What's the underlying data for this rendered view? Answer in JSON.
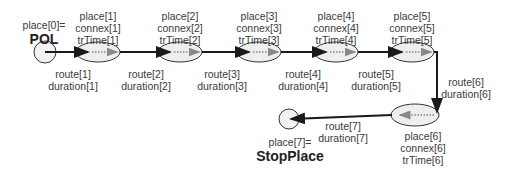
{
  "diagram": {
    "start": {
      "label": "place[0]=",
      "name": "POL"
    },
    "end": {
      "label": "place[7]=",
      "name": "StopPlace"
    },
    "places": [
      {
        "lines": [
          "place[1]",
          "connex[1]",
          "trTime[1]"
        ]
      },
      {
        "lines": [
          "place[2]",
          "connex[2]",
          "trTime[2]"
        ]
      },
      {
        "lines": [
          "place[3]",
          "connex[3]",
          "trTime[3]"
        ]
      },
      {
        "lines": [
          "place[4]",
          "connex[4]",
          "trTime[4]"
        ]
      },
      {
        "lines": [
          "place[5]",
          "connex[5]",
          "trTime[5]"
        ]
      },
      {
        "lines": [
          "place[6]",
          "connex[6]",
          "trTime[6]"
        ]
      }
    ],
    "routes": [
      {
        "lines": [
          "route[1]",
          "duration[1]"
        ]
      },
      {
        "lines": [
          "route[2]",
          "duration[2]"
        ]
      },
      {
        "lines": [
          "route[3]",
          "duration[3]"
        ]
      },
      {
        "lines": [
          "route[4]",
          "duration[4]"
        ]
      },
      {
        "lines": [
          "route[5]",
          "duration[5]"
        ]
      },
      {
        "lines": [
          "route[6]",
          "duration[6]"
        ]
      },
      {
        "lines": [
          "route[7]",
          "duration[7]"
        ]
      }
    ],
    "colors": {
      "line": "#1a1a1a",
      "dotted": "#888888",
      "fill": "#eeeeee"
    }
  }
}
